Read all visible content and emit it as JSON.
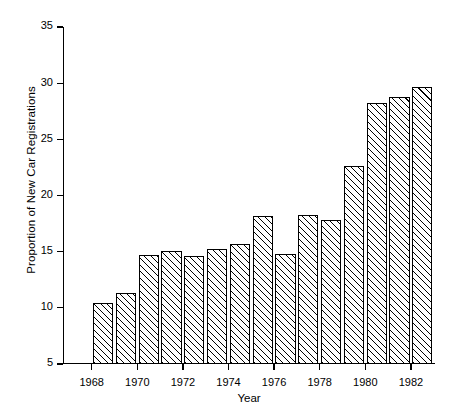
{
  "chart_data": {
    "type": "bar",
    "title": "",
    "xlabel": "Year",
    "ylabel": "Proportion of New Car Registrations",
    "categories": [
      1968,
      1969,
      1970,
      1971,
      1972,
      1973,
      1974,
      1975,
      1976,
      1977,
      1978,
      1979,
      1980,
      1981,
      1982
    ],
    "values": [
      10.4,
      11.3,
      14.7,
      15.1,
      14.6,
      15.2,
      15.7,
      18.2,
      14.8,
      18.3,
      17.8,
      22.6,
      28.2,
      28.8,
      29.7
    ],
    "ylim": [
      5,
      35
    ],
    "yticks": [
      5,
      10,
      15,
      20,
      25,
      30,
      35
    ],
    "ytick_labels": [
      "5",
      "10",
      "15",
      "20",
      "25",
      "30",
      "35"
    ],
    "xticks": [
      1968,
      1970,
      1972,
      1974,
      1976,
      1978,
      1980,
      1982
    ],
    "xtick_labels": [
      "1968",
      "1970",
      "1972",
      "1974",
      "1976",
      "1978",
      "1980",
      "1982"
    ],
    "grid": false,
    "legend": null,
    "bar_fill": "hatch-diagonal-45",
    "bar_edge_color": "#000000",
    "background_color": "#ffffff"
  }
}
